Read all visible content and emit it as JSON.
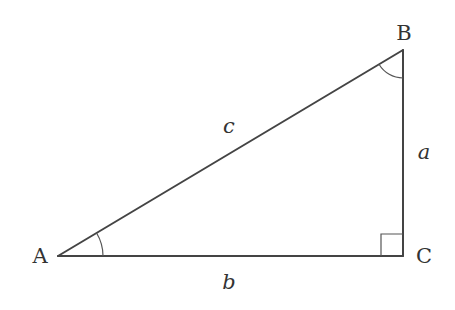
{
  "diagram": {
    "type": "right-triangle",
    "vertices": {
      "A": {
        "label": "A",
        "x": 58,
        "y": 256
      },
      "B": {
        "label": "B",
        "x": 403,
        "y": 50
      },
      "C": {
        "label": "C",
        "x": 403,
        "y": 256
      }
    },
    "sides": {
      "a": {
        "label": "a",
        "from": "B",
        "to": "C"
      },
      "b": {
        "label": "b",
        "from": "A",
        "to": "C"
      },
      "c": {
        "label": "c",
        "from": "A",
        "to": "B"
      }
    },
    "angle_marks": {
      "A": "arc",
      "B": "arc",
      "C": "right-angle-square"
    },
    "colors": {
      "stroke": "#444444",
      "text": "#333333",
      "background": "#ffffff"
    }
  }
}
